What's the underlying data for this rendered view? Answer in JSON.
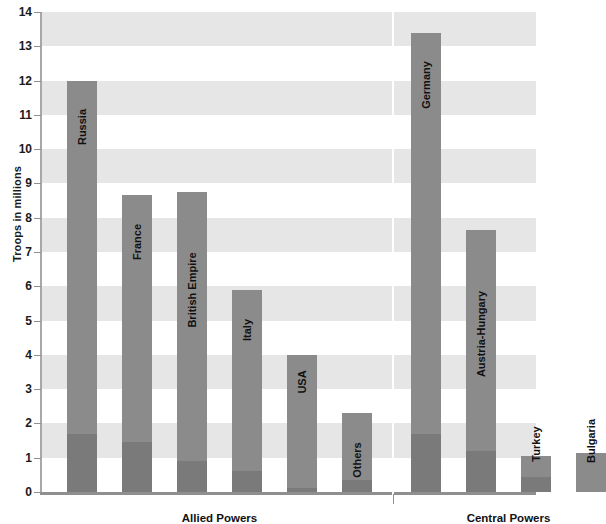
{
  "chart_data": {
    "type": "bar",
    "title": "",
    "subtitle": "",
    "xlabel": "",
    "ylabel": "Troops in millions",
    "ylim": [
      0,
      14
    ],
    "ytick_step": 1,
    "yticks": [
      "14",
      "13",
      "12",
      "11",
      "10",
      "9",
      "8",
      "7",
      "6",
      "5",
      "4",
      "3",
      "2",
      "1",
      "0"
    ],
    "grid": false,
    "background_bands": true,
    "legend": [],
    "stacked": true,
    "categories": [
      "Russia",
      "France",
      "British Empire",
      "Italy",
      "USA",
      "Others",
      "Germany",
      "Austria-Hungary",
      "Turkey",
      "Bulgaria"
    ],
    "values": [
      12.0,
      8.65,
      8.75,
      5.9,
      4.0,
      2.3,
      13.4,
      7.65,
      1.05,
      1.15
    ],
    "series": [
      {
        "name": "Lower segment",
        "values": [
          1.7,
          1.45,
          0.9,
          0.6,
          0.12,
          0.35,
          1.7,
          1.2,
          0.45,
          0.0
        ]
      },
      {
        "name": "Total troops",
        "values": [
          12.0,
          8.65,
          8.75,
          5.9,
          4.0,
          2.3,
          13.4,
          7.65,
          1.05,
          1.15
        ]
      }
    ],
    "groups": [
      {
        "label": "Allied Powers",
        "categories": [
          "Russia",
          "France",
          "British Empire",
          "Italy",
          "USA",
          "Others"
        ]
      },
      {
        "label": "Central Powers",
        "categories": [
          "Germany",
          "Austria-Hungary",
          "Turkey",
          "Bulgaria"
        ]
      }
    ],
    "colors": {
      "bar": "#8b8b8b",
      "bar_lower": "#7a7a7a",
      "band": "#e6e6e6",
      "axis": "#8f8f8f",
      "text": "#111111",
      "background": "#ffffff"
    }
  }
}
